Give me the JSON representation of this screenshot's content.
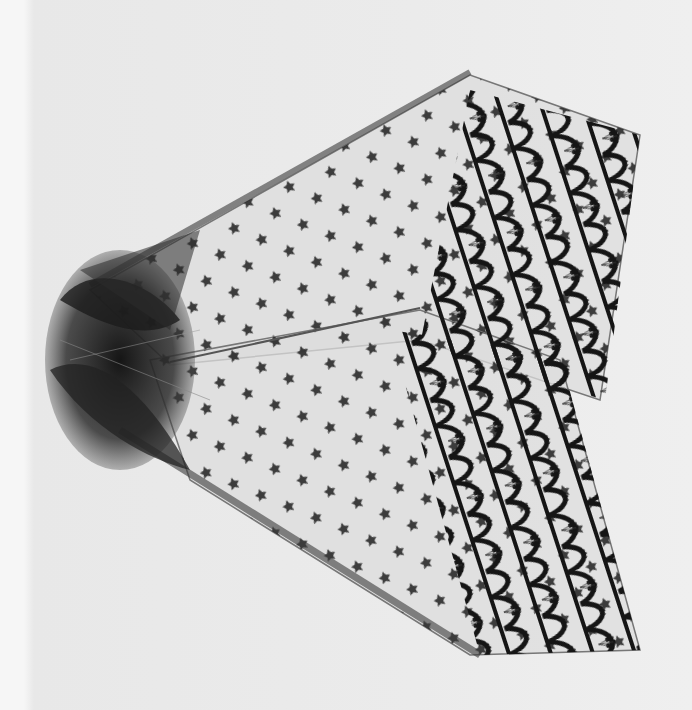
{
  "image": {
    "subject": "black lace veil photographed flat",
    "description": "Grayscale photograph of a sheer net veil with star sprigs, three bands of scalloped lace along the right, gathered tulle at the left",
    "colors": {
      "background": "#ebebeb",
      "net": "#d9d9d9",
      "lace": "#1a1a1a",
      "tulle": "#2a2a2a"
    }
  }
}
